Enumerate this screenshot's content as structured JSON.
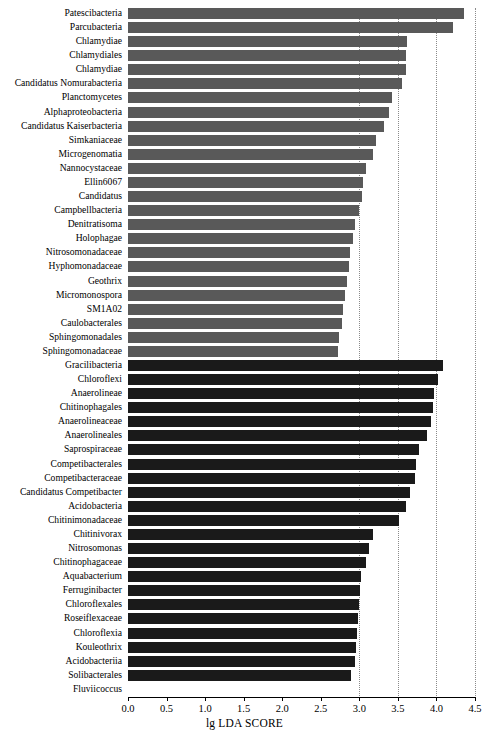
{
  "chart_data": {
    "type": "bar",
    "orientation": "horizontal",
    "title": "",
    "xlabel": "lg LDA SCORE",
    "ylabel": "",
    "xlim": [
      0.0,
      4.5
    ],
    "xticks": [
      "0.0",
      "0.5",
      "1.0",
      "1.5",
      "2.0",
      "2.5",
      "3.0",
      "3.5",
      "4.0",
      "4.5"
    ],
    "xtick_values": [
      0.0,
      0.5,
      1.0,
      1.5,
      2.0,
      2.5,
      3.0,
      3.5,
      4.0,
      4.5
    ],
    "gridlines": [
      3.0,
      3.5,
      4.0,
      4.5
    ],
    "grid": "vertical-dotted",
    "legend": [],
    "group_colors": {
      "group_a": "#595959",
      "group_b": "#1a1a1a"
    },
    "categories": [
      "Patescibacteria",
      "Parcubacteria",
      "Chlamydiae",
      "Chlamydiales",
      "Chlamydiae",
      "Candidatus Nomurabacteria",
      "Planctomycetes",
      "Alphaproteobacteria",
      "Candidatus Kaiserbacteria",
      "Simkaniaceae",
      "Microgenomatia",
      "Nannocystaceae",
      "Ellin6067",
      "Candidatus",
      "Campbellbacteria",
      "Denitratisoma",
      "Holophagae",
      "Nitrosomonadaceae",
      "Hyphomonadaceae",
      "Geothrix",
      "Micromonospora",
      "SM1A02",
      "Caulobacterales",
      "Sphingomonadales",
      "Sphingomonadaceae",
      "Gracilibacteria",
      "Chloroflexi",
      "Anaerolineae",
      "Chitinophagales",
      "Anaerolineaceae",
      "Anaerolineales",
      "Saprospiraceae",
      "Competibacterales",
      "Competibacteraceae",
      "Candidatus Competibacter",
      "Acidobacteria",
      "Chitinimonadaceae",
      "Chitinivorax",
      "Nitrosomonas",
      "Chitinophagaceae",
      "Aquabacterium",
      "Ferruginibacter",
      "Chloroflexales",
      "Roseiflexaceae",
      "Chloroflexia",
      "Kouleothrix",
      "Acidobacteriia",
      "Solibacterales",
      "Fluviicoccus"
    ],
    "values": [
      4.36,
      4.21,
      3.62,
      3.61,
      3.61,
      3.55,
      3.42,
      3.38,
      3.32,
      3.22,
      3.18,
      3.09,
      3.05,
      3.03,
      2.99,
      2.94,
      2.92,
      2.88,
      2.86,
      2.84,
      2.82,
      2.79,
      2.77,
      2.74,
      2.72,
      4.09,
      4.02,
      3.97,
      3.95,
      3.93,
      3.88,
      3.78,
      3.74,
      3.72,
      3.66,
      3.6,
      3.51,
      3.18,
      3.12,
      3.08,
      3.02,
      3.01,
      2.99,
      2.98,
      2.97,
      2.96,
      2.94,
      2.89,
      0.0
    ],
    "groups": [
      "group_a",
      "group_a",
      "group_a",
      "group_a",
      "group_a",
      "group_a",
      "group_a",
      "group_a",
      "group_a",
      "group_a",
      "group_a",
      "group_a",
      "group_a",
      "group_a",
      "group_a",
      "group_a",
      "group_a",
      "group_a",
      "group_a",
      "group_a",
      "group_a",
      "group_a",
      "group_a",
      "group_a",
      "group_a",
      "group_b",
      "group_b",
      "group_b",
      "group_b",
      "group_b",
      "group_b",
      "group_b",
      "group_b",
      "group_b",
      "group_b",
      "group_b",
      "group_b",
      "group_b",
      "group_b",
      "group_b",
      "group_b",
      "group_b",
      "group_b",
      "group_b",
      "group_b",
      "group_b",
      "group_b",
      "group_b",
      "group_b"
    ]
  }
}
